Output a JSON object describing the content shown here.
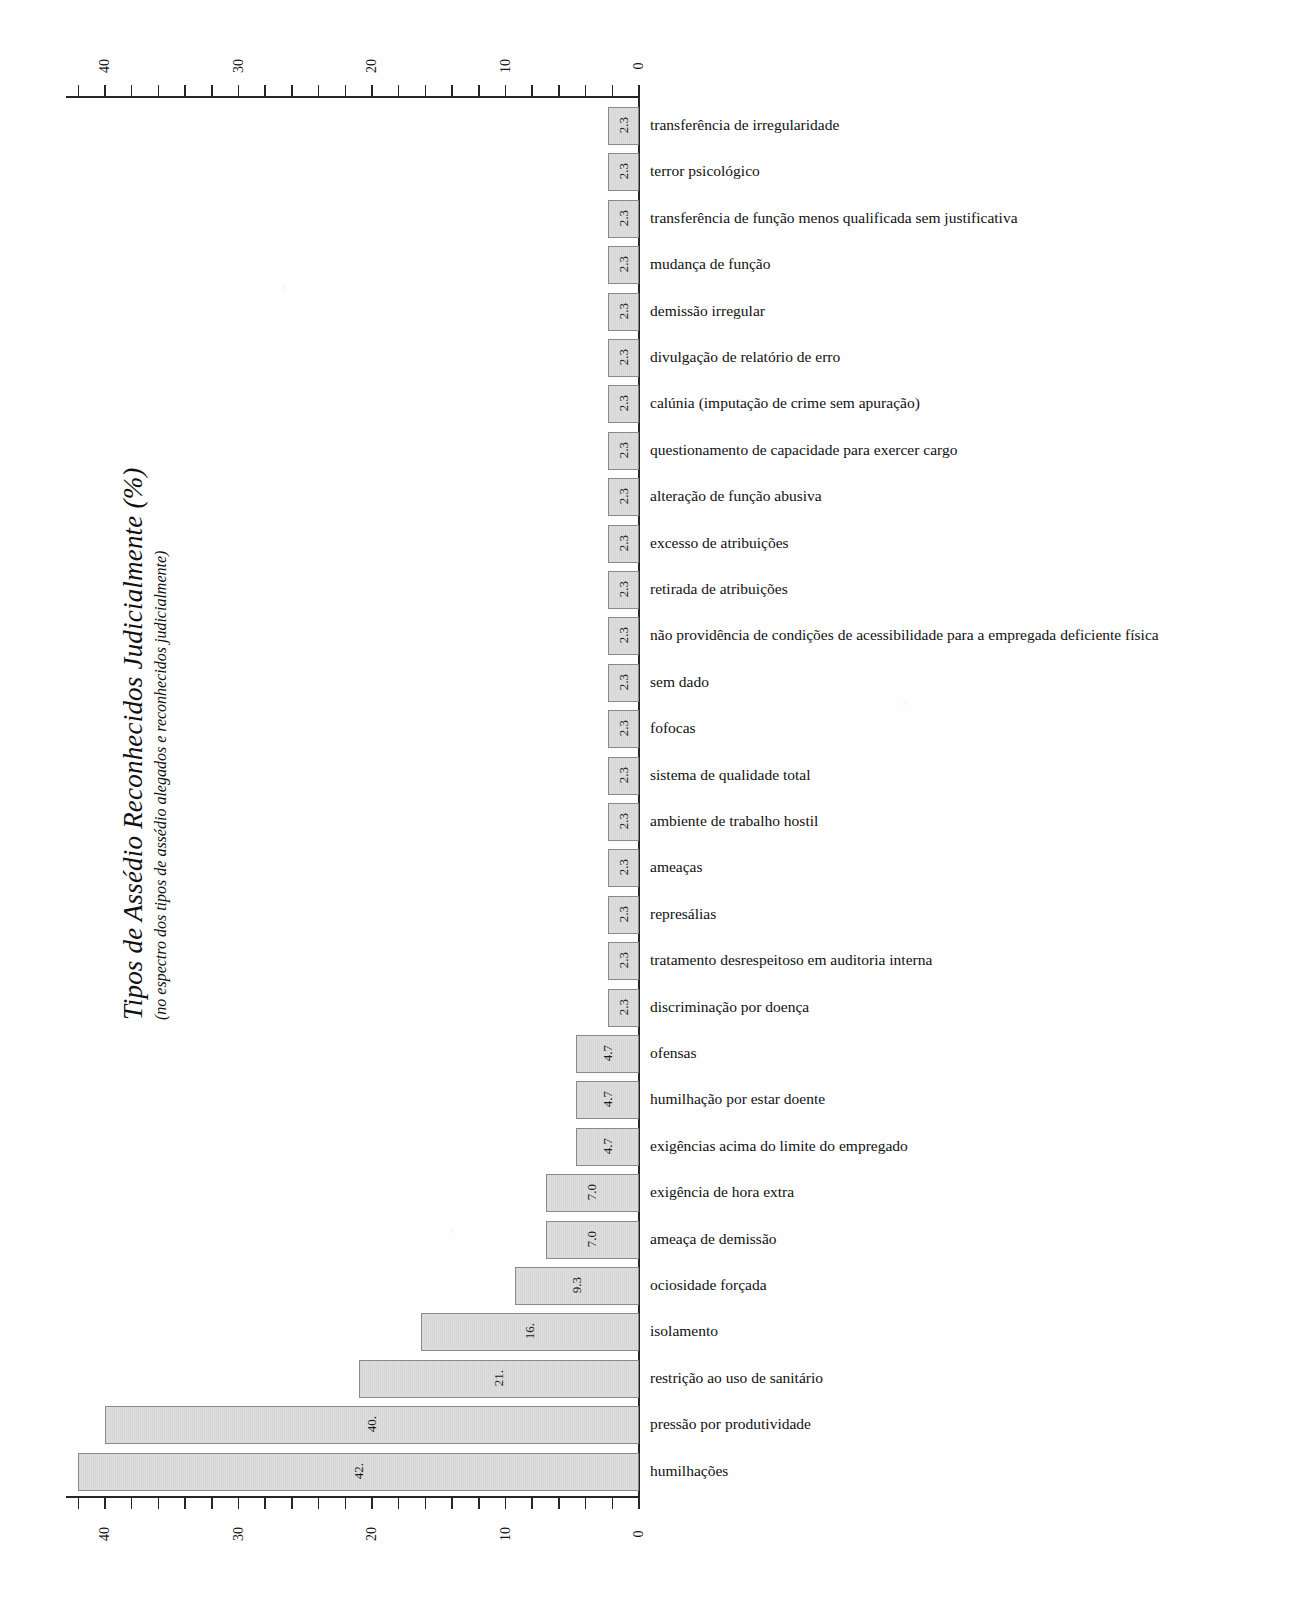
{
  "chart_data": {
    "type": "bar",
    "orientation": "horizontal",
    "title": "Tipos de Assédio Reconhecidos Judicialmente (%)",
    "subtitle": "(no espectro dos tipos de assédio alegados e reconhecidos judicialmente)",
    "xlabel": "",
    "ylabel": "",
    "xlim": [
      0,
      44
    ],
    "axis_reversed": true,
    "grid": false,
    "legend": null,
    "tick_labels": [
      "40",
      "30",
      "20",
      "10",
      "0"
    ],
    "tick_values": [
      40,
      30,
      20,
      10,
      0
    ],
    "tick_step_minor": 2,
    "value_label_format": "one-decimal",
    "categories": [
      "transferência de irregularidade",
      "terror psicológico",
      "transferência de função menos qualificada sem justificativa",
      "mudança de função",
      "demissão irregular",
      "divulgação de relatório de erro",
      "calúnia (imputação de crime sem apuração)",
      "questionamento de capacidade para exercer cargo",
      "alteração de função abusiva",
      "excesso de atribuições",
      "retirada de atribuições",
      "não providência de condições de acessibilidade para a empregada deficiente física",
      "sem dado",
      "fofocas",
      "sistema de qualidade total",
      "ambiente de trabalho hostil",
      "ameaças",
      "represálias",
      "tratamento desrespeitoso em auditoria interna",
      "discriminação por doença",
      "ofensas",
      "humilhação por estar doente",
      "exigências acima do limite do empregado",
      "exigência de hora extra",
      "ameaça de demissão",
      "ociosidade forçada",
      "isolamento",
      "restrição ao uso de sanitário",
      "pressão por produtividade",
      "humilhações"
    ],
    "values": [
      2.3,
      2.3,
      2.3,
      2.3,
      2.3,
      2.3,
      2.3,
      2.3,
      2.3,
      2.3,
      2.3,
      2.3,
      2.3,
      2.3,
      2.3,
      2.3,
      2.3,
      2.3,
      2.3,
      2.3,
      4.7,
      4.7,
      4.7,
      7.0,
      7.0,
      9.3,
      16.3,
      21.0,
      40.0,
      42.0
    ],
    "value_labels": [
      "2.3",
      "2.3",
      "2.3",
      "2.3",
      "2.3",
      "2.3",
      "2.3",
      "2.3",
      "2.3",
      "2.3",
      "2.3",
      "2.3",
      "2.3",
      "2.3",
      "2.3",
      "2.3",
      "2.3",
      "2.3",
      "2.3",
      "2.3",
      "4.7",
      "4.7",
      "4.7",
      "7.0",
      "7.0",
      "9.3",
      "16.",
      "21.",
      "40.",
      "42."
    ],
    "colors": {
      "bar_fill": "#d9d9d9",
      "bar_border": "#8a8a8a",
      "axis": "#262626",
      "text": "#111111",
      "background": "#fefefe"
    }
  }
}
